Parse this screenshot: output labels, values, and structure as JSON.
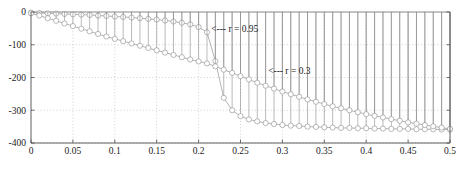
{
  "chart_data": {
    "type": "line",
    "title": "",
    "subtitle": "",
    "xlabel": "",
    "ylabel": "",
    "xlim": [
      0,
      0.5
    ],
    "ylim": [
      -400,
      0
    ],
    "grid": true,
    "grid_style": "dotted",
    "legend_position": "none",
    "marker": "circle-open",
    "stems": true,
    "stem_baseline": 0,
    "xticks": [
      0,
      0.05,
      0.1,
      0.15,
      0.2,
      0.25,
      0.3,
      0.35,
      0.4,
      0.45,
      0.5
    ],
    "xtick_labels": [
      "0",
      "0.05",
      "0.1",
      "0.15",
      "0.2",
      "0.25",
      "0.3",
      "0.35",
      "0.4",
      "0.45",
      "0.5"
    ],
    "yticks": [
      0,
      -100,
      -200,
      -300,
      -400
    ],
    "ytick_labels": [
      "0",
      "-100",
      "-200",
      "-300",
      "-400"
    ],
    "x": [
      0,
      0.01,
      0.02,
      0.03,
      0.04,
      0.05,
      0.06,
      0.07,
      0.08,
      0.09,
      0.1,
      0.11,
      0.12,
      0.13,
      0.14,
      0.15,
      0.16,
      0.17,
      0.18,
      0.19,
      0.2,
      0.21,
      0.22,
      0.23,
      0.24,
      0.25,
      0.26,
      0.27,
      0.28,
      0.29,
      0.3,
      0.31,
      0.32,
      0.33,
      0.34,
      0.35,
      0.36,
      0.37,
      0.38,
      0.39,
      0.4,
      0.41,
      0.42,
      0.43,
      0.44,
      0.45,
      0.46,
      0.47,
      0.48,
      0.49,
      0.5
    ],
    "series": [
      {
        "name": "r = 0.95",
        "values": [
          -2,
          -3,
          -4,
          -5,
          -6,
          -7,
          -8,
          -9,
          -11,
          -12,
          -14,
          -15,
          -17,
          -19,
          -21,
          -23,
          -26,
          -29,
          -33,
          -38,
          -46,
          -62,
          -150,
          -262,
          -300,
          -318,
          -328,
          -334,
          -339,
          -342,
          -345,
          -347,
          -348,
          -350,
          -351,
          -352,
          -353,
          -354,
          -354,
          -355,
          -355,
          -356,
          -356,
          -357,
          -357,
          -357,
          -358,
          -358,
          -358,
          -359,
          -359
        ]
      },
      {
        "name": "r = 0.3",
        "values": [
          -4,
          -11,
          -19,
          -27,
          -35,
          -43,
          -51,
          -59,
          -67,
          -75,
          -82,
          -89,
          -96,
          -103,
          -110,
          -117,
          -124,
          -131,
          -138,
          -145,
          -151,
          -157,
          -166,
          -176,
          -186,
          -196,
          -206,
          -216,
          -225,
          -234,
          -243,
          -251,
          -259,
          -267,
          -274,
          -281,
          -288,
          -294,
          -300,
          -306,
          -312,
          -317,
          -322,
          -327,
          -332,
          -337,
          -341,
          -345,
          -349,
          -353,
          -357
        ]
      }
    ],
    "annotations": [
      {
        "label": "<--- r = 0.95",
        "text": "r = 0.95",
        "arrow": "<---",
        "x": 0.215,
        "y": -50
      },
      {
        "label": "<--- r = 0.3",
        "text": "r = 0.3",
        "arrow": "<---",
        "x": 0.283,
        "y": -180
      }
    ],
    "colors": {
      "axis": "#4d4d4d",
      "grid": "#b3b3b3",
      "series_line": "#808080",
      "marker_edge": "#8c8c8c",
      "text": "#1a1a1a"
    }
  }
}
